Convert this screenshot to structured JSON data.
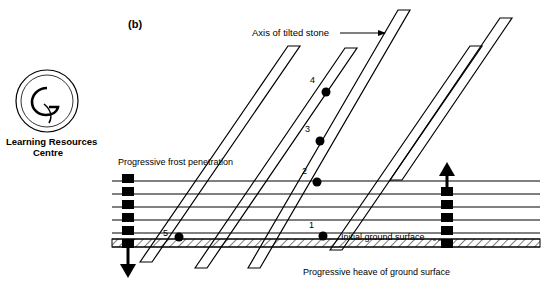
{
  "figure": {
    "panel_label": "(b)",
    "labels": {
      "axis_of_tilted_stone": "Axis of tilted stone",
      "progressive_frost_penetration": "Progressive frost penetration",
      "initial_ground_surface": "Initial ground surface",
      "progressive_heave": "Progressive heave of ground surface"
    },
    "stone_position_numbers": [
      "4",
      "3",
      "2",
      "1",
      "5"
    ],
    "colors": {
      "ink": "#000000",
      "background": "#ffffff"
    }
  },
  "logo": {
    "ring_text_top": "UNIVERSITY OF GLAMORGAN",
    "ring_text_bottom": "PRIFYSGOL MORGANNWG",
    "monogram": "G",
    "caption_line1": "Learning Resources",
    "caption_line2": "Centre"
  }
}
